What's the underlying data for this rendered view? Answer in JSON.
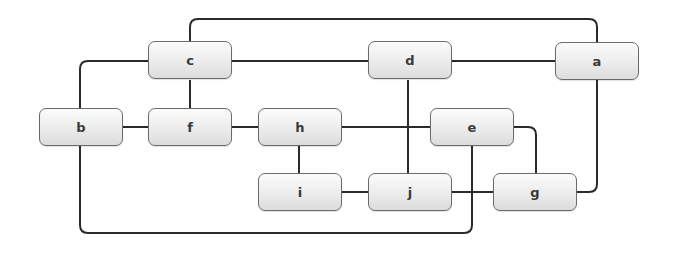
{
  "diagram": {
    "type": "graph",
    "nodes": [
      {
        "id": "a",
        "label": "a"
      },
      {
        "id": "b",
        "label": "b"
      },
      {
        "id": "c",
        "label": "c"
      },
      {
        "id": "d",
        "label": "d"
      },
      {
        "id": "e",
        "label": "e"
      },
      {
        "id": "f",
        "label": "f"
      },
      {
        "id": "g",
        "label": "g"
      },
      {
        "id": "h",
        "label": "h"
      },
      {
        "id": "i",
        "label": "i"
      },
      {
        "id": "j",
        "label": "j"
      }
    ],
    "edges": [
      {
        "from": "c",
        "to": "a"
      },
      {
        "from": "c",
        "to": "d"
      },
      {
        "from": "d",
        "to": "a"
      },
      {
        "from": "c",
        "to": "b"
      },
      {
        "from": "c",
        "to": "f"
      },
      {
        "from": "b",
        "to": "f"
      },
      {
        "from": "f",
        "to": "h"
      },
      {
        "from": "h",
        "to": "e"
      },
      {
        "from": "h",
        "to": "i"
      },
      {
        "from": "i",
        "to": "j"
      },
      {
        "from": "d",
        "to": "j"
      },
      {
        "from": "j",
        "to": "g"
      },
      {
        "from": "e",
        "to": "g"
      },
      {
        "from": "g",
        "to": "a"
      },
      {
        "from": "b",
        "to": "e"
      }
    ]
  }
}
